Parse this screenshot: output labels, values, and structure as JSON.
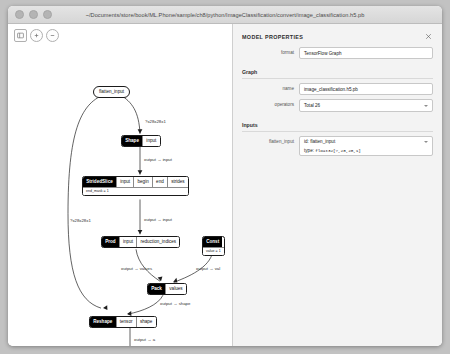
{
  "window": {
    "title": "~/Documents/store/book/ML.Phone/sample/ch8/python/ImageClassification/convert/image_classification.h5.pb"
  },
  "toolbar": {
    "buttons": [
      {
        "name": "sidebar-toggle",
        "icon": "sidebar-icon"
      },
      {
        "name": "zoom-in",
        "icon": "zoom-in-icon"
      },
      {
        "name": "zoom-out",
        "icon": "zoom-out-icon"
      }
    ]
  },
  "properties": {
    "title": "MODEL PROPERTIES",
    "close_label": "✕",
    "format": {
      "label": "format",
      "value": "TensorFlow Graph"
    },
    "graph_section": "Graph",
    "name": {
      "label": "name",
      "value": "image_classification.h5.pb"
    },
    "operators": {
      "label": "operators",
      "value": "Total 26"
    },
    "inputs_section": "Inputs",
    "flatten_input": {
      "label": "flatten_input",
      "id_value": "id: flatten_input",
      "type_label": "type: ",
      "type_value": "float32[?,28,28,1]"
    }
  },
  "graph": {
    "nodes": [
      {
        "name": "flatten_input",
        "head": "flatten_input",
        "ports": [],
        "attr": null,
        "shape": "pill"
      },
      {
        "name": "shape",
        "head": "Shape",
        "ports": [
          "input"
        ],
        "attr": null,
        "shape": "box"
      },
      {
        "name": "stridedslice",
        "head": "StridedSlice",
        "ports": [
          "input",
          "begin",
          "end",
          "strides"
        ],
        "attr": "end_mask = 1",
        "shape": "box"
      },
      {
        "name": "prod",
        "head": "Prod",
        "ports": [
          "input",
          "reduction_indices"
        ],
        "attr": null,
        "shape": "box"
      },
      {
        "name": "const",
        "head": "Const",
        "ports": [],
        "attr": "value = 1",
        "shape": "box"
      },
      {
        "name": "pack",
        "head": "Pack",
        "ports": [
          "values"
        ],
        "attr": null,
        "shape": "box"
      },
      {
        "name": "reshape",
        "head": "Reshape",
        "ports": [
          "tensor",
          "shape"
        ],
        "attr": null,
        "shape": "box"
      }
    ],
    "edge_labels": [
      {
        "name": "edge-input-shape",
        "text": "?x28x28x1"
      },
      {
        "name": "edge-shape-stridedslice",
        "text": "output → input"
      },
      {
        "name": "edge-stridedslice-prod",
        "text": "output → input"
      },
      {
        "name": "edge-input-reshape",
        "text": "?x28x28x1"
      },
      {
        "name": "edge-prod-pack",
        "text": "output → values"
      },
      {
        "name": "edge-const-pack",
        "text": "output → val"
      },
      {
        "name": "edge-pack-reshape",
        "text": "output → shape"
      },
      {
        "name": "edge-reshape-out",
        "text": "output → a"
      }
    ]
  }
}
